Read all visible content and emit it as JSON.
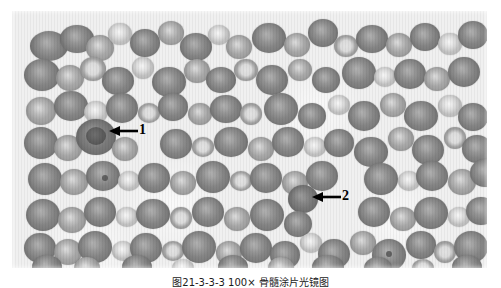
{
  "figure": {
    "caption": "图21-3-3-3  100×  骨髓涂片光镜图",
    "micrograph": {
      "name": "bone-marrow-smear-light-micrograph",
      "modality": "light-microscopy",
      "rendering": "grayscale",
      "magnification": "100×",
      "background_color": "#efeeec",
      "plate": {
        "left": 12,
        "top": 11,
        "width": 475,
        "height": 257
      }
    },
    "annotations": [
      {
        "id": "1",
        "label": "1",
        "arrow_direction": "left",
        "arrow_color": "#000000",
        "tail_x": 137,
        "tip_x": 110,
        "y": 131,
        "label_x": 139,
        "label_y": 124
      },
      {
        "id": "2",
        "label": "2",
        "arrow_direction": "left",
        "arrow_color": "#000000",
        "tail_x": 340,
        "tip_x": 313,
        "y": 197,
        "label_x": 342,
        "label_y": 190
      }
    ]
  }
}
